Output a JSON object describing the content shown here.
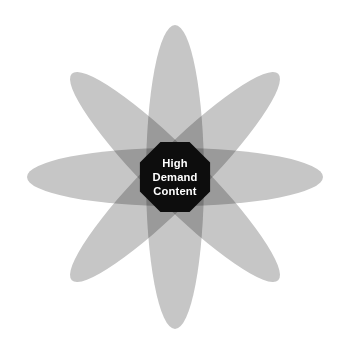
{
  "diagram": {
    "type": "overlapping-ellipse-radial",
    "background_color": "#ffffff",
    "center": {
      "x": 175,
      "y": 177
    },
    "petal": {
      "fill_color": "#c6c6c6",
      "blend": "multiply",
      "count": 4,
      "lobe_count": 8
    },
    "overlap_colors": {
      "one_layer": "#c6c6c6",
      "two_layer": "#9a9a9a",
      "three_layer": "#787878",
      "core": "#0d0d0d"
    },
    "ellipses": [
      {
        "name": "ellipse-horizontal",
        "angle_deg": 0,
        "rx": 148,
        "ry": 29
      },
      {
        "name": "ellipse-diagonal-up",
        "angle_deg": 45,
        "rx": 146,
        "ry": 27
      },
      {
        "name": "ellipse-vertical",
        "angle_deg": 90,
        "rx": 152,
        "ry": 29
      },
      {
        "name": "ellipse-diagonal-down",
        "angle_deg": 135,
        "rx": 146,
        "ry": 27
      }
    ],
    "core_badge": {
      "name": "core-badge",
      "shape": "octagon",
      "fill_color": "#0d0d0d",
      "text_color": "#ffffff",
      "radius": 38,
      "lines": [
        "High",
        "Demand",
        "Content"
      ]
    }
  }
}
